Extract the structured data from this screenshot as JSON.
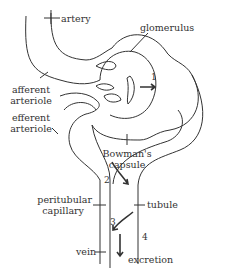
{
  "diagram": {
    "labels": {
      "artery": "artery",
      "glomerulus": "glomerulus",
      "afferent_arteriole_1": "afferent",
      "afferent_arteriole_2": "arteriole",
      "efferent_arteriole_1": "efferent",
      "efferent_arteriole_2": "arteriole",
      "bowmans_capsule_1": "Bowman's",
      "bowmans_capsule_2": "capsule",
      "peritubular_capillary_1": "peritubular",
      "peritubular_capillary_2": "capillary",
      "tubule": "tubule",
      "vein": "vein",
      "excretion": "excretion"
    },
    "steps": [
      "1",
      "2",
      "3",
      "4"
    ],
    "colors": {
      "line": "#333333",
      "background": "#ffffff"
    }
  }
}
